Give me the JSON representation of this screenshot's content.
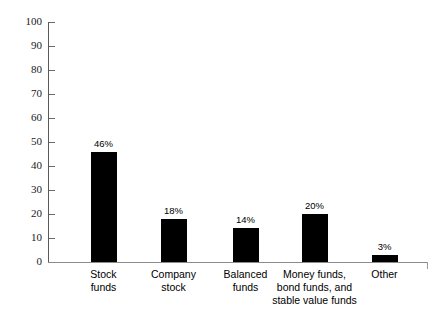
{
  "chart_data": {
    "type": "bar",
    "title": "",
    "subtitle": "",
    "xlabel": "",
    "ylabel": "",
    "ylim": [
      0,
      100
    ],
    "ytick_step": 10,
    "ytick_labels": [
      "0",
      "10",
      "20",
      "30",
      "40",
      "50",
      "60",
      "70",
      "80",
      "90",
      "100"
    ],
    "ytick_values": [
      0,
      10,
      20,
      30,
      40,
      50,
      60,
      70,
      80,
      90,
      100
    ],
    "grid": false,
    "legend": "none",
    "bar_color": "#000000",
    "axis_color": "#5a5a5a",
    "categories": [
      "Stock\nfunds",
      "Company\nstock",
      "Balanced\nfunds",
      "Money funds,\nbond funds, and\nstable value funds",
      "Other"
    ],
    "values": [
      46,
      18,
      14,
      20,
      3
    ],
    "data_labels": [
      "46%",
      "18%",
      "14%",
      "20%",
      "3%"
    ]
  }
}
